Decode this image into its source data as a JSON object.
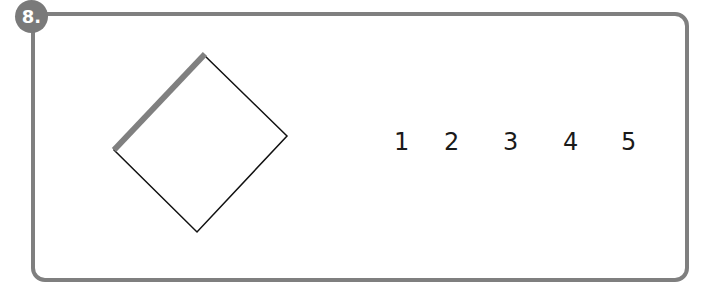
{
  "question": {
    "number_label": "8.",
    "shape": "square rotated (diamond) with one highlighted edge",
    "highlight_color": "#7f7f7f",
    "options": [
      "1",
      "2",
      "3",
      "4",
      "5"
    ]
  }
}
